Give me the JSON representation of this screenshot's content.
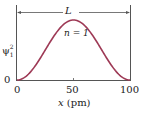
{
  "chart_data": {
    "type": "line",
    "title": "",
    "xlabel": "x (pm)",
    "ylabel": "ψ₁²",
    "x_ticks": [
      "0",
      "50",
      "100"
    ],
    "y_ticks": [
      "0"
    ],
    "xlim": [
      0,
      100
    ],
    "annotations": [
      "L",
      "n = 1"
    ],
    "series": [
      {
        "name": "n = 1",
        "color": "#9e3a56",
        "x": [
          0,
          10,
          20,
          30,
          40,
          50,
          60,
          70,
          80,
          90,
          100
        ],
        "values": [
          0,
          0.095,
          0.345,
          0.655,
          0.905,
          1.0,
          0.905,
          0.655,
          0.345,
          0.095,
          0
        ]
      }
    ]
  },
  "labels": {
    "y_axis": "ψ",
    "y_sup": "2",
    "y_sub": "1",
    "y_zero": "0",
    "x0": "0",
    "x50": "50",
    "x100": "100",
    "x_axis": "x (pm)",
    "length": "L",
    "state": "n = 1"
  }
}
